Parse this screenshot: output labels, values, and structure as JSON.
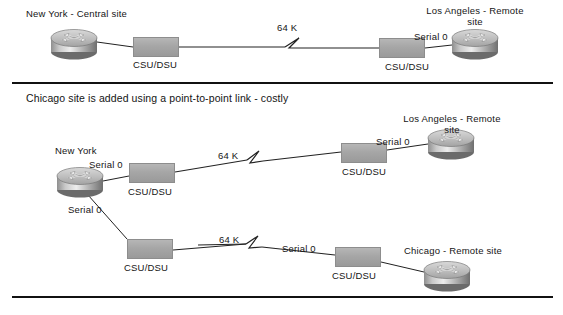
{
  "diagram": {
    "type": "network-topology",
    "link_speed_label": "64 K",
    "csu_label": "CSU/DSU",
    "serial_label": "Serial 0"
  },
  "panels": [
    {
      "id": "panel-top",
      "heading": "",
      "nodes": [
        {
          "id": "ny-top",
          "kind": "router",
          "label": "New York - Central site"
        },
        {
          "id": "csu-ny-top",
          "kind": "csu",
          "label": "CSU/DSU"
        },
        {
          "id": "csu-la-top",
          "kind": "csu",
          "label": "CSU/DSU"
        },
        {
          "id": "la-top",
          "kind": "router",
          "label": "Los Angeles - Remote site"
        }
      ],
      "links": [
        {
          "id": "link-ny-la-top",
          "speed": "64 K",
          "interface": "Serial 0"
        }
      ]
    },
    {
      "id": "panel-bottom",
      "heading": "Chicago site is added using a point-to-point link - costly",
      "nodes": [
        {
          "id": "ny-bottom",
          "kind": "router",
          "label": "New York"
        },
        {
          "id": "csu-ny-la",
          "kind": "csu",
          "label": "CSU/DSU"
        },
        {
          "id": "csu-ny-chi",
          "kind": "csu",
          "label": "CSU/DSU"
        },
        {
          "id": "csu-la-bottom",
          "kind": "csu",
          "label": "CSU/DSU"
        },
        {
          "id": "csu-chi",
          "kind": "csu",
          "label": "CSU/DSU"
        },
        {
          "id": "la-bottom",
          "kind": "router",
          "label": "Los Angeles - Remote site"
        },
        {
          "id": "chi-bottom",
          "kind": "router",
          "label": "Chicago - Remote site"
        }
      ],
      "links": [
        {
          "id": "link-ny-la-bottom",
          "speed": "64 K",
          "interface": "Serial 0"
        },
        {
          "id": "link-ny-chi-bottom",
          "speed": "64 K",
          "interface": "Serial 0"
        }
      ]
    }
  ],
  "labels": {
    "top": {
      "new_york": "New York - Central site",
      "los_angeles_line1": "Los Angeles - Remote",
      "los_angeles_line2": "site",
      "csu_left": "CSU/DSU",
      "csu_right": "CSU/DSU",
      "speed": "64 K",
      "serial_la": "Serial 0"
    },
    "bottom": {
      "heading": "Chicago site is added using a point-to-point link - costly",
      "new_york": "New York",
      "serial_ny_upper": "Serial 0",
      "serial_ny_lower": "Serial 0",
      "csu_ny_upper": "CSU/DSU",
      "csu_ny_lower": "CSU/DSU",
      "csu_la": "CSU/DSU",
      "csu_chicago": "CSU/DSU",
      "speed_la": "64 K",
      "speed_chicago": "64 K",
      "serial_la": "Serial 0",
      "serial_chicago": "Serial 0",
      "los_angeles_line1": "Los Angeles - Remote",
      "los_angeles_line2": "site",
      "chicago": "Chicago - Remote site"
    }
  },
  "colors": {
    "ink": "#141414",
    "device_gray": "#a6a6a6",
    "page_background": "#ffffff"
  }
}
